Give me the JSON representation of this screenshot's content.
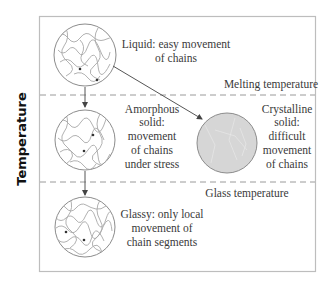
{
  "axis": {
    "label": "Temperature"
  },
  "thresholds": [
    {
      "label": "Melting temperature",
      "y": 95
    },
    {
      "label": "Glass temperature",
      "y": 182
    }
  ],
  "states": {
    "liquid": {
      "lines": [
        "Liquid: easy movement",
        "of chains"
      ]
    },
    "amorphous": {
      "lines": [
        "Amorphous",
        "solid:",
        "movement",
        "of chains",
        "under stress"
      ]
    },
    "crystalline": {
      "lines": [
        "Crystalline",
        "solid:",
        "difficult",
        "movement",
        "of chains"
      ]
    },
    "glassy": {
      "lines": [
        "Glassy: only local",
        "movement of",
        "chain segments"
      ]
    }
  },
  "colors": {
    "frame": "#bdbdbd",
    "dash": "#9a9a9a",
    "circle_stroke": "#8c8c8c",
    "crystal_fill": "#d6d6d6",
    "arrow": "#555555"
  }
}
